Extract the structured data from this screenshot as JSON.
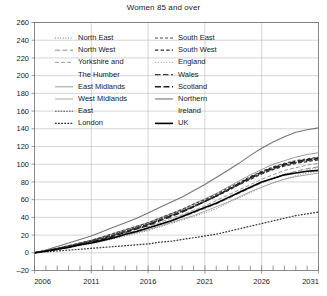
{
  "chart_data": {
    "type": "line",
    "title": "Women 85 and over",
    "xlabel": "",
    "ylabel": "",
    "xlim": [
      2006,
      2031
    ],
    "ylim": [
      -20,
      260
    ],
    "grid": true,
    "legend_position": "upper-left-inside",
    "xtick_labels": [
      "2006",
      "2011",
      "2016",
      "2021",
      "2026",
      "2031"
    ],
    "xticks": [
      2006,
      2011,
      2016,
      2021,
      2026,
      2031
    ],
    "ytick_labels": [
      "-20",
      "0",
      "20",
      "40",
      "60",
      "80",
      "100",
      "120",
      "140",
      "160",
      "180",
      "200",
      "220",
      "240",
      "260"
    ],
    "yticks": [
      -20,
      0,
      20,
      40,
      60,
      80,
      100,
      120,
      140,
      160,
      180,
      200,
      220,
      240,
      260
    ],
    "x": [
      2006,
      2007,
      2008,
      2009,
      2010,
      2011,
      2012,
      2013,
      2014,
      2015,
      2016,
      2017,
      2018,
      2019,
      2020,
      2021,
      2022,
      2023,
      2024,
      2025,
      2026,
      2027,
      2028,
      2029,
      2030,
      2031
    ],
    "series": [
      {
        "name": "North East",
        "style": "dotted-fine",
        "color": "#7d7d7d",
        "width": 1.0,
        "dash": "1,1.6",
        "values": [
          0,
          2,
          4,
          6,
          8,
          10,
          13,
          16,
          19,
          22,
          25,
          29,
          33,
          37,
          41,
          45,
          50,
          56,
          62,
          68,
          74,
          79,
          83,
          87,
          90,
          92
        ]
      },
      {
        "name": "North West",
        "style": "dashed-long",
        "color": "#8a8a8a",
        "width": 1.0,
        "dash": "5,2.5",
        "values": [
          0,
          2,
          4,
          7,
          9,
          12,
          15,
          18,
          21,
          25,
          28,
          32,
          36,
          40,
          45,
          50,
          55,
          61,
          67,
          73,
          79,
          84,
          88,
          92,
          95,
          97
        ]
      },
      {
        "name": "Yorkshire and The Humber",
        "style": "dashed-medium",
        "color": "#9a9a9a",
        "width": 1.0,
        "dash": "4,2",
        "values": [
          0,
          2,
          5,
          7,
          10,
          13,
          16,
          19,
          23,
          27,
          30,
          34,
          39,
          43,
          48,
          53,
          59,
          65,
          71,
          77,
          83,
          88,
          93,
          96,
          99,
          101
        ]
      },
      {
        "name": "East Midlands",
        "style": "solid-thin",
        "color": "#8f8f8f",
        "width": 0.9,
        "dash": "none",
        "values": [
          0,
          3,
          5,
          8,
          11,
          14,
          18,
          22,
          26,
          30,
          34,
          39,
          44,
          49,
          55,
          61,
          67,
          74,
          81,
          88,
          94,
          100,
          104,
          108,
          111,
          113
        ]
      },
      {
        "name": "West Midlands",
        "style": "solid-thin",
        "color": "#9d9d9d",
        "width": 0.9,
        "dash": "none",
        "values": [
          0,
          2,
          4,
          6,
          9,
          11,
          14,
          17,
          20,
          23,
          26,
          30,
          34,
          38,
          42,
          47,
          52,
          57,
          63,
          69,
          74,
          79,
          83,
          86,
          88,
          90
        ]
      },
      {
        "name": "East",
        "style": "dotted-dense",
        "color": "#5a5a5a",
        "width": 1.1,
        "dash": "1.6,1.2",
        "values": [
          0,
          2,
          5,
          8,
          11,
          14,
          17,
          21,
          25,
          29,
          33,
          38,
          43,
          48,
          53,
          59,
          65,
          71,
          78,
          84,
          90,
          95,
          99,
          102,
          105,
          107
        ]
      },
      {
        "name": "London",
        "style": "dotted-dense",
        "color": "#333333",
        "width": 1.2,
        "dash": "1.8,1.3",
        "values": [
          0,
          1,
          2,
          3,
          4,
          5,
          6,
          7,
          8,
          9,
          10,
          12,
          13,
          15,
          17,
          19,
          21,
          24,
          27,
          30,
          33,
          36,
          39,
          42,
          44,
          46
        ]
      },
      {
        "name": "South East",
        "style": "dash-dot-loose",
        "color": "#4a4a4a",
        "width": 1.2,
        "dash": "3,2",
        "values": [
          0,
          2,
          5,
          8,
          11,
          14,
          18,
          22,
          26,
          30,
          34,
          39,
          44,
          49,
          55,
          60,
          66,
          73,
          79,
          86,
          92,
          97,
          101,
          104,
          106,
          108
        ]
      },
      {
        "name": "South West",
        "style": "dash-dot-loose",
        "color": "#2e2e2e",
        "width": 1.3,
        "dash": "3.4,2.2",
        "values": [
          0,
          2,
          4,
          7,
          10,
          13,
          16,
          20,
          24,
          28,
          32,
          37,
          42,
          47,
          52,
          58,
          64,
          70,
          77,
          83,
          89,
          94,
          98,
          101,
          103,
          105
        ]
      },
      {
        "name": "England",
        "style": "dotted-fine",
        "color": "#a5a5a5",
        "width": 1.0,
        "dash": "1.2,1.6",
        "values": [
          0,
          2,
          4,
          6,
          9,
          12,
          15,
          18,
          22,
          25,
          29,
          33,
          37,
          42,
          46,
          51,
          57,
          63,
          69,
          75,
          80,
          85,
          89,
          92,
          94,
          96
        ]
      },
      {
        "name": "Wales",
        "style": "dashed-long",
        "color": "#3d3d3d",
        "width": 1.3,
        "dash": "5.5,2.5",
        "values": [
          0,
          2,
          5,
          7,
          10,
          13,
          17,
          20,
          24,
          28,
          32,
          37,
          42,
          47,
          52,
          58,
          64,
          71,
          77,
          84,
          90,
          95,
          99,
          102,
          104,
          106
        ]
      },
      {
        "name": "Scotland",
        "style": "dashed-bold",
        "color": "#1f1f1f",
        "width": 1.5,
        "dash": "6,2.5",
        "values": [
          0,
          2,
          4,
          7,
          9,
          12,
          15,
          19,
          23,
          27,
          31,
          36,
          41,
          46,
          52,
          58,
          64,
          71,
          78,
          85,
          91,
          96,
          100,
          103,
          105,
          107
        ]
      },
      {
        "name": "Northern Ireland",
        "style": "solid-gray",
        "color": "#767676",
        "width": 1.1,
        "dash": "none",
        "values": [
          0,
          3,
          7,
          11,
          15,
          19,
          24,
          29,
          34,
          39,
          45,
          51,
          57,
          63,
          70,
          77,
          85,
          93,
          101,
          110,
          118,
          125,
          131,
          136,
          139,
          141
        ]
      },
      {
        "name": "UK",
        "style": "solid-bold",
        "color": "#000000",
        "width": 1.6,
        "dash": "none",
        "values": [
          0,
          2,
          4,
          6,
          9,
          11,
          14,
          17,
          21,
          24,
          28,
          32,
          36,
          41,
          46,
          51,
          56,
          62,
          68,
          74,
          80,
          84,
          88,
          90,
          92,
          93
        ]
      }
    ]
  },
  "legend": {
    "column1": [
      {
        "label": "North East",
        "series": "North East"
      },
      {
        "label": "North West",
        "series": "North West"
      },
      {
        "label": "Yorkshire and",
        "series": "Yorkshire and The Humber"
      },
      {
        "label": "The Humber",
        "series": "Yorkshire and The Humber"
      },
      {
        "label": "East Midlands",
        "series": "East Midlands"
      },
      {
        "label": "West Midlands",
        "series": "West Midlands"
      },
      {
        "label": "East",
        "series": "East"
      },
      {
        "label": "London",
        "series": "London"
      }
    ],
    "column2": [
      {
        "label": "South East",
        "series": "South East"
      },
      {
        "label": "South West",
        "series": "South West"
      },
      {
        "label": "England",
        "series": "England"
      },
      {
        "label": "Wales",
        "series": "Wales"
      },
      {
        "label": "Scotland",
        "series": "Scotland"
      },
      {
        "label": "Northern",
        "series": "Northern Ireland"
      },
      {
        "label": "Ireland",
        "series": "Northern Ireland"
      },
      {
        "label": "UK",
        "series": "UK"
      }
    ]
  }
}
